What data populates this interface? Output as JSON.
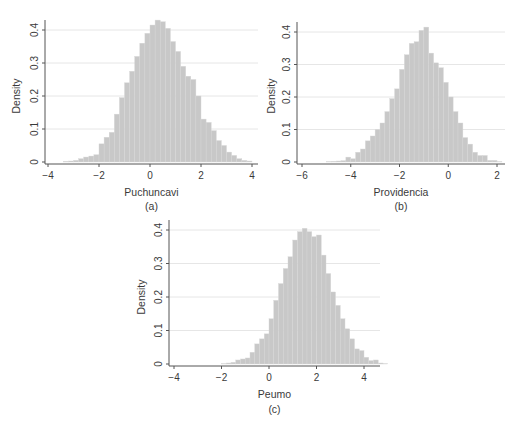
{
  "figure": {
    "bar_color": "#c8c8c8",
    "axis_color": "#555555",
    "grid_color": "#e6e6e6"
  },
  "chart_data": [
    {
      "type": "bar",
      "panel_label": "(a)",
      "title": "",
      "xlabel": "Puchuncavi",
      "ylabel": "Density",
      "xlim": [
        -4,
        4
      ],
      "ylim": [
        0,
        0.43
      ],
      "xticks": [
        -4,
        -2,
        0,
        2,
        4
      ],
      "xtick_labels": [
        "−4",
        "−2",
        "0",
        "2",
        "4"
      ],
      "yticks": [
        0,
        0.1,
        0.2,
        0.3,
        0.4
      ],
      "ytick_labels": [
        "0",
        "0.1",
        "0.2",
        "0.3",
        "0.4"
      ],
      "grid": true,
      "bin_width": 0.2,
      "bin_start": -3.4,
      "values": [
        0.002,
        0.003,
        0.005,
        0.01,
        0.015,
        0.018,
        0.022,
        0.055,
        0.075,
        0.09,
        0.145,
        0.195,
        0.24,
        0.275,
        0.32,
        0.36,
        0.39,
        0.415,
        0.43,
        0.425,
        0.405,
        0.365,
        0.335,
        0.29,
        0.26,
        0.25,
        0.2,
        0.13,
        0.12,
        0.095,
        0.065,
        0.05,
        0.03,
        0.02,
        0.01,
        0.005,
        0.003
      ]
    },
    {
      "type": "bar",
      "panel_label": "(b)",
      "title": "",
      "xlabel": "Providencia",
      "ylabel": "Density",
      "xlim": [
        -6.2,
        2.2
      ],
      "ylim": [
        0,
        0.43
      ],
      "xticks": [
        -6,
        -4,
        -2,
        0,
        2
      ],
      "xtick_labels": [
        "−6",
        "−4",
        "−2",
        "0",
        "2"
      ],
      "yticks": [
        0,
        0.1,
        0.2,
        0.3,
        0.4
      ],
      "ytick_labels": [
        "0",
        "0.1",
        "0.2",
        "0.3",
        "0.4"
      ],
      "grid": true,
      "bin_width": 0.2,
      "bin_start": -5.0,
      "values": [
        0.001,
        0.002,
        0.003,
        0.004,
        0.015,
        0.01,
        0.03,
        0.04,
        0.065,
        0.08,
        0.1,
        0.12,
        0.155,
        0.195,
        0.225,
        0.285,
        0.33,
        0.365,
        0.37,
        0.405,
        0.415,
        0.335,
        0.305,
        0.29,
        0.245,
        0.2,
        0.155,
        0.12,
        0.075,
        0.055,
        0.03,
        0.02,
        0.02,
        0.005,
        0.005,
        0.001
      ]
    },
    {
      "type": "bar",
      "panel_label": "(c)",
      "title": "",
      "xlabel": "Peumo",
      "ylabel": "Density",
      "xlim": [
        -4.2,
        4.8
      ],
      "ylim": [
        0,
        0.42
      ],
      "xticks": [
        -4,
        -2,
        0,
        2,
        4
      ],
      "xtick_labels": [
        "−4",
        "−2",
        "0",
        "2",
        "4"
      ],
      "yticks": [
        0,
        0.1,
        0.2,
        0.3,
        0.4
      ],
      "ytick_labels": [
        "0",
        "0.1",
        "0.2",
        "0.3",
        "0.4"
      ],
      "grid": true,
      "bin_width": 0.2,
      "bin_start": -2.0,
      "values": [
        0.001,
        0.003,
        0.005,
        0.012,
        0.015,
        0.018,
        0.035,
        0.06,
        0.075,
        0.09,
        0.135,
        0.19,
        0.24,
        0.285,
        0.32,
        0.37,
        0.395,
        0.405,
        0.395,
        0.38,
        0.385,
        0.325,
        0.27,
        0.215,
        0.175,
        0.135,
        0.105,
        0.075,
        0.045,
        0.04,
        0.02,
        0.01,
        0.012,
        0.003,
        0.001
      ]
    }
  ]
}
